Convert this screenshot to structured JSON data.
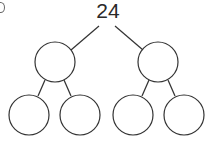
{
  "diagram": {
    "type": "number-bond-tree",
    "root": {
      "label": "24"
    },
    "level1": [
      {
        "label": ""
      },
      {
        "label": ""
      }
    ],
    "level2": [
      {
        "label": ""
      },
      {
        "label": ""
      },
      {
        "label": ""
      },
      {
        "label": ""
      }
    ],
    "stroke_color": "#333333"
  }
}
